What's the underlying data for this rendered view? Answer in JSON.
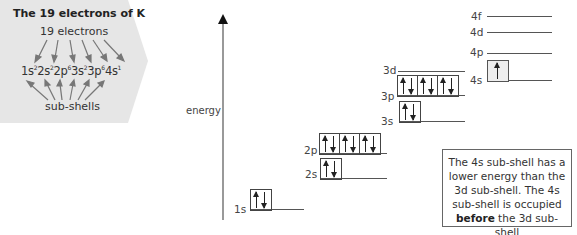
{
  "panel": {
    "title": "The 19 electrons of K",
    "top_label": "19 electrons",
    "config_parts": [
      {
        "base": "1s",
        "sup": "2"
      },
      {
        "base": "2s",
        "sup": "2"
      },
      {
        "base": "2p",
        "sup": "6"
      },
      {
        "base": "3s",
        "sup": "2"
      },
      {
        "base": "3p",
        "sup": "6"
      },
      {
        "base": "4s",
        "sup": "1"
      }
    ],
    "bottom_label": "sub-shells",
    "background": "#e8e8e8"
  },
  "axis": {
    "label": "energy"
  },
  "levels": {
    "s1": {
      "label": "1s",
      "electrons": [
        2
      ]
    },
    "s2": {
      "label": "2s",
      "electrons": [
        2
      ]
    },
    "p2": {
      "label": "2p",
      "electrons": [
        2,
        2,
        2
      ]
    },
    "s3": {
      "label": "3s",
      "electrons": [
        2
      ]
    },
    "p3": {
      "label": "3p",
      "electrons": [
        2,
        2,
        2
      ]
    },
    "d3": {
      "label": "3d",
      "electrons": []
    },
    "s4": {
      "label": "4s",
      "electrons": [
        1
      ]
    },
    "p4": {
      "label": "4p",
      "electrons": []
    },
    "d4": {
      "label": "4d",
      "electrons": []
    },
    "f4": {
      "label": "4f",
      "electrons": []
    }
  },
  "note": {
    "text_before": "The 4s sub-shell has a lower energy than the 3d sub-shell. The 4s sub-shell is occupied ",
    "bold": "before",
    "text_after": " the 3d sub-shell"
  }
}
